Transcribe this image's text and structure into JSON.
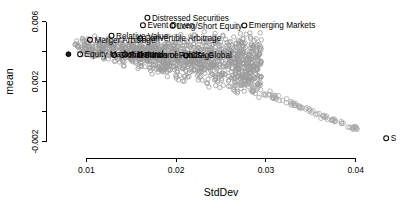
{
  "chart_data": {
    "type": "scatter",
    "title": "",
    "xlabel": "StdDev",
    "ylabel": "mean",
    "xlim": [
      0.0055,
      0.0465
    ],
    "ylim": [
      -0.0031,
      0.0069
    ],
    "xticks": [
      "0.01",
      "0.02",
      "0.03",
      "0.04"
    ],
    "xtick_values": [
      0.01,
      0.02,
      0.03,
      0.04
    ],
    "yticks": [
      "0.006",
      "0.002",
      "-0.002"
    ],
    "ytick_values": [
      0.006,
      0.002,
      -0.002
    ],
    "grid": false,
    "legend": "none",
    "point_style": "open-circle",
    "cloud_color": "#9a9a9a",
    "highlight_color": "#000000",
    "labeled_points": [
      {
        "label": "Distressed Securities",
        "x": 0.0168,
        "y": 0.00625,
        "marker": "open-circle"
      },
      {
        "label": "Event Driven",
        "x": 0.0163,
        "y": 0.00575,
        "marker": "open-circle"
      },
      {
        "label": "Long/Short Equity",
        "x": 0.0196,
        "y": 0.00572,
        "marker": "open-circle"
      },
      {
        "label": "Relative Value",
        "x": 0.0128,
        "y": 0.00505,
        "marker": "open-circle"
      },
      {
        "label": "Convertible Arbitrage",
        "x": 0.016,
        "y": 0.00487,
        "marker": "open-circle"
      },
      {
        "label": "Merger Arbitrage",
        "x": 0.0104,
        "y": 0.00478,
        "marker": "open-circle"
      },
      {
        "label": "Equity Market Neutral",
        "x": 0.0093,
        "y": 0.00382,
        "marker": "open-circle"
      },
      {
        "label": "Fixed Income Arbitrage",
        "x": 0.0143,
        "y": 0.0038,
        "marker": "open-circle"
      },
      {
        "label": "Funds of Funds",
        "x": 0.016,
        "y": 0.00378,
        "marker": "open-circle"
      },
      {
        "label": "Global Macro",
        "x": 0.0131,
        "y": 0.00376,
        "marker": "open-circle"
      },
      {
        "label": "CTA Global",
        "x": 0.0211,
        "y": 0.00374,
        "marker": "open-circle"
      },
      {
        "label": "Emerging Markets",
        "x": 0.0276,
        "y": 0.00574,
        "marker": "open-circle"
      },
      {
        "label": "S",
        "x": 0.0434,
        "y": -0.00178,
        "marker": "open-circle"
      }
    ],
    "edge_point": {
      "x": 0.008,
      "y": 0.00382,
      "marker": "filled-circle"
    },
    "cloud_description": "dense wedge of open grey circles fanning right-downward from x=0.008 to x=0.030, plus a sparse descending tail of open circles from x=0.028 to x=0.040"
  }
}
